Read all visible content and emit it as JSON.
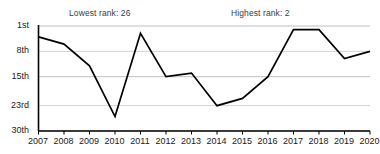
{
  "chart_data": {
    "type": "line",
    "title": "",
    "subtitle": "",
    "xlabel": "",
    "ylabel": "",
    "x": [
      2007,
      2008,
      2009,
      2010,
      2011,
      2012,
      2013,
      2014,
      2015,
      2016,
      2017,
      2018,
      2019,
      2020
    ],
    "categories": [
      "2007",
      "2008",
      "2009",
      "2010",
      "2011",
      "2012",
      "2013",
      "2014",
      "2015",
      "2016",
      "2017",
      "2018",
      "2019",
      "2020"
    ],
    "values": [
      4,
      6,
      12,
      26,
      3,
      15,
      14,
      23,
      21,
      15,
      2,
      2,
      10,
      8
    ],
    "series": [
      {
        "name": "Rank",
        "values": [
          4,
          6,
          12,
          26,
          3,
          15,
          14,
          23,
          21,
          15,
          2,
          2,
          10,
          8
        ]
      }
    ],
    "ylim": [
      1,
      30
    ],
    "y_inverted": true,
    "ytick_values": [
      1,
      8,
      15,
      23,
      30
    ],
    "ytick_labels": [
      "1st",
      "8th",
      "15th",
      "23rd",
      "30th"
    ],
    "xtick_labels": [
      "2007",
      "2008",
      "2009",
      "2010",
      "2011",
      "2012",
      "2013",
      "2014",
      "2015",
      "2016",
      "2017",
      "2018",
      "2019",
      "2020"
    ],
    "grid": true,
    "legend": "none",
    "line_color": "#000000",
    "grid_color": "#bfbfbf",
    "axis_color": "#000000",
    "background_color": "#ffffff",
    "annotations": [
      {
        "id": "lowest",
        "text": "Lowest rank: 26",
        "value": 26,
        "year": 2010
      },
      {
        "id": "highest",
        "text": "Highest rank: 2",
        "value": 2,
        "year": 2017
      }
    ]
  },
  "annotations": {
    "lowest": "Lowest rank: 26",
    "highest": "Highest rank: 2"
  }
}
